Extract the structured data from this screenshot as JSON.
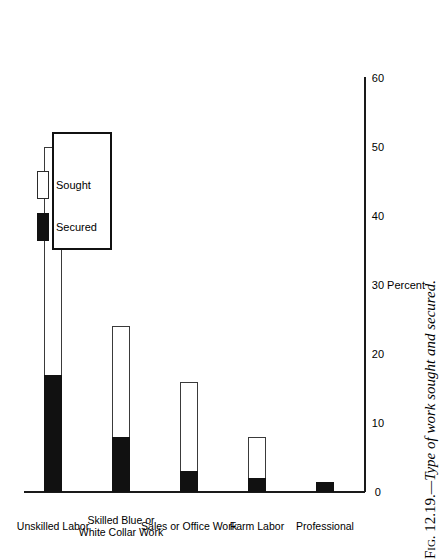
{
  "figure": {
    "caption_prefix": "Fig. 12.19.",
    "caption_separator": "—",
    "caption_text": "Type of work sought and secured.",
    "caption_full": "Fig. 12.19.—Type of work sought and secured.",
    "orientation": "rotated-90-ccw"
  },
  "legend": {
    "items": [
      {
        "label": "Sought",
        "swatch": "open-white-rectangle",
        "color": "#ffffff"
      },
      {
        "label": "Secured",
        "swatch": "solid-black-rectangle",
        "color": "#111111"
      }
    ]
  },
  "axis": {
    "value_title": "Percent",
    "ticks": [
      "0",
      "10",
      "20",
      "30",
      "40",
      "50",
      "60"
    ]
  },
  "chart_data": {
    "type": "bar",
    "title": "Type of work sought and secured.",
    "xlabel": "",
    "ylabel": "Percent",
    "ylim": [
      0,
      60
    ],
    "grid": false,
    "legend_position": "upper-right",
    "orientation": "vertical",
    "stacked_overlay": true,
    "categories": [
      "Unskilled Labor",
      "Skilled Blue or White Collar Work",
      "Sales or Office Work",
      "Farm Labor",
      "Professional"
    ],
    "category_label_lines": [
      [
        "Unskilled Labor"
      ],
      [
        "Skilled Blue or",
        "White Collar Work"
      ],
      [
        "Sales or Office Work"
      ],
      [
        "Farm Labor"
      ],
      [
        "Professional"
      ]
    ],
    "series": [
      {
        "name": "Sought",
        "values": [
          50,
          24,
          16,
          8,
          1.5
        ]
      },
      {
        "name": "Secured",
        "values": [
          17,
          8,
          3,
          2,
          1.5
        ]
      }
    ],
    "tick_values": [
      0,
      10,
      20,
      30,
      40,
      50,
      60
    ]
  }
}
